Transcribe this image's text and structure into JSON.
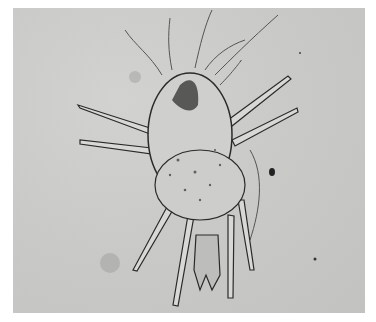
{
  "image": {
    "subject": "Photomicrograph of a mite (dorsal view) with eight jointed legs and long setae",
    "style": "grayscale light microscopy",
    "colors": {
      "background": "#c8c8c6",
      "outline": "#2a2a2a",
      "frame": "#ffffff"
    }
  }
}
